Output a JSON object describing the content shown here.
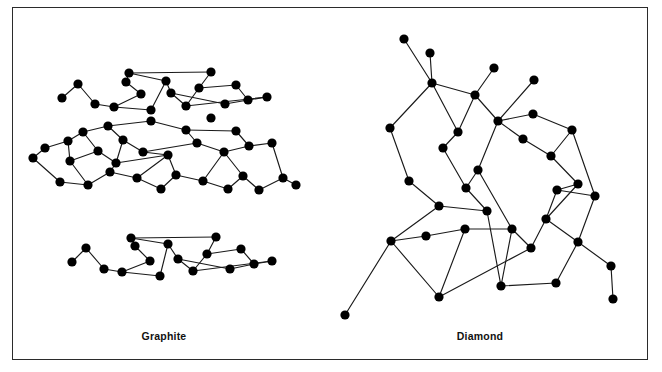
{
  "figure": {
    "border_color": "#2b2b2b",
    "background": "#ffffff",
    "node_color": "#000000",
    "bond_color": "#1a1a1a"
  },
  "labels": {
    "graphite": "Graphite",
    "diamond": "Diamond"
  },
  "caption": {
    "text": ""
  },
  "chart_data": {
    "type": "diagram",
    "title": "",
    "panels": [
      {
        "name": "graphite",
        "label": "Graphite",
        "structure": "layered hexagonal sheets",
        "layer_count": 3,
        "node_radius": 4.6,
        "layers": [
          {
            "name": "top-layer",
            "nodes": [
              [
                62,
                98
              ],
              [
                78,
                84
              ],
              [
                95,
                104
              ],
              [
                126,
                82
              ],
              [
                141,
                94
              ],
              [
                114,
                107
              ],
              [
                129,
                73
              ],
              [
                166,
                81
              ],
              [
                171,
                93
              ],
              [
                199,
                88
              ],
              [
                186,
                106
              ],
              [
                151,
                110
              ],
              [
                211,
                72
              ],
              [
                236,
                85
              ],
              [
                248,
                100
              ],
              [
                225,
                104
              ],
              [
                267,
                97
              ]
            ],
            "bonds": [
              [
                0,
                1
              ],
              [
                1,
                2
              ],
              [
                2,
                5
              ],
              [
                5,
                4
              ],
              [
                4,
                3
              ],
              [
                3,
                6
              ],
              [
                6,
                7
              ],
              [
                7,
                11
              ],
              [
                11,
                5
              ],
              [
                7,
                8
              ],
              [
                8,
                10
              ],
              [
                10,
                9
              ],
              [
                9,
                12
              ],
              [
                12,
                6
              ],
              [
                8,
                15
              ],
              [
                15,
                14
              ],
              [
                14,
                13
              ],
              [
                13,
                9
              ],
              [
                14,
                16
              ],
              [
                16,
                10
              ]
            ]
          },
          {
            "name": "middle-layer",
            "nodes": [
              [
                33,
                158
              ],
              [
                45,
                148
              ],
              [
                68,
                141
              ],
              [
                83,
                132
              ],
              [
                98,
                151
              ],
              [
                70,
                161
              ],
              [
                108,
                126
              ],
              [
                123,
                140
              ],
              [
                143,
                152
              ],
              [
                116,
                163
              ],
              [
                151,
                121
              ],
              [
                186,
                130
              ],
              [
                197,
                143
              ],
              [
                168,
                155
              ],
              [
                211,
                118
              ],
              [
                236,
                131
              ],
              [
                249,
                146
              ],
              [
                224,
                152
              ],
              [
                272,
                143
              ],
              [
                60,
                182
              ],
              [
                88,
                185
              ],
              [
                110,
                172
              ],
              [
                137,
                178
              ],
              [
                161,
                189
              ],
              [
                176,
                175
              ],
              [
                203,
                181
              ],
              [
                228,
                189
              ],
              [
                243,
                176
              ],
              [
                283,
                178
              ],
              [
                296,
                185
              ],
              [
                259,
                190
              ]
            ],
            "bonds": [
              [
                0,
                1
              ],
              [
                1,
                2
              ],
              [
                2,
                5
              ],
              [
                5,
                4
              ],
              [
                4,
                3
              ],
              [
                3,
                2
              ],
              [
                3,
                6
              ],
              [
                6,
                7
              ],
              [
                7,
                9
              ],
              [
                9,
                4
              ],
              [
                7,
                8
              ],
              [
                8,
                13
              ],
              [
                13,
                9
              ],
              [
                8,
                12
              ],
              [
                12,
                11
              ],
              [
                11,
                10
              ],
              [
                10,
                6
              ],
              [
                12,
                17
              ],
              [
                17,
                16
              ],
              [
                16,
                15
              ],
              [
                15,
                11
              ],
              [
                16,
                18
              ],
              [
                18,
                28
              ],
              [
                0,
                19
              ],
              [
                19,
                20
              ],
              [
                20,
                5
              ],
              [
                20,
                21
              ],
              [
                21,
                9
              ],
              [
                21,
                22
              ],
              [
                22,
                13
              ],
              [
                22,
                23
              ],
              [
                23,
                24
              ],
              [
                24,
                13
              ],
              [
                24,
                25
              ],
              [
                25,
                17
              ],
              [
                25,
                26
              ],
              [
                26,
                27
              ],
              [
                27,
                17
              ],
              [
                27,
                30
              ],
              [
                30,
                28
              ],
              [
                28,
                29
              ]
            ]
          },
          {
            "name": "bottom-layer",
            "nodes": [
              [
                72,
                262
              ],
              [
                86,
                248
              ],
              [
                104,
                269
              ],
              [
                135,
                246
              ],
              [
                150,
                261
              ],
              [
                122,
                272
              ],
              [
                131,
                238
              ],
              [
                168,
                244
              ],
              [
                178,
                259
              ],
              [
                207,
                254
              ],
              [
                193,
                271
              ],
              [
                160,
                276
              ],
              [
                216,
                237
              ],
              [
                241,
                249
              ],
              [
                254,
                264
              ],
              [
                230,
                269
              ],
              [
                272,
                261
              ]
            ],
            "bonds": [
              [
                0,
                1
              ],
              [
                1,
                2
              ],
              [
                2,
                5
              ],
              [
                5,
                4
              ],
              [
                4,
                3
              ],
              [
                3,
                6
              ],
              [
                6,
                7
              ],
              [
                7,
                11
              ],
              [
                11,
                5
              ],
              [
                7,
                8
              ],
              [
                8,
                10
              ],
              [
                10,
                9
              ],
              [
                9,
                12
              ],
              [
                12,
                6
              ],
              [
                8,
                15
              ],
              [
                15,
                14
              ],
              [
                14,
                13
              ],
              [
                13,
                9
              ],
              [
                14,
                16
              ],
              [
                16,
                10
              ]
            ]
          }
        ]
      },
      {
        "name": "diamond",
        "label": "Diamond",
        "structure": "tetrahedral cubic lattice",
        "node_radius": 4.6,
        "nodes": [
          [
            404,
            39
          ],
          [
            430,
            53
          ],
          [
            432,
            83
          ],
          [
            475,
            95
          ],
          [
            494,
            68
          ],
          [
            498,
            121
          ],
          [
            534,
            80
          ],
          [
            390,
            128
          ],
          [
            443,
            148
          ],
          [
            458,
            132
          ],
          [
            523,
            139
          ],
          [
            533,
            114
          ],
          [
            551,
            156
          ],
          [
            572,
            130
          ],
          [
            578,
            184
          ],
          [
            409,
            181
          ],
          [
            466,
            188
          ],
          [
            478,
            170
          ],
          [
            439,
            206
          ],
          [
            487,
            211
          ],
          [
            557,
            190
          ],
          [
            546,
            219
          ],
          [
            595,
            196
          ],
          [
            391,
            241
          ],
          [
            426,
            236
          ],
          [
            465,
            229
          ],
          [
            512,
            229
          ],
          [
            531,
            248
          ],
          [
            578,
            242
          ],
          [
            611,
            266
          ],
          [
            345,
            315
          ],
          [
            439,
            297
          ],
          [
            501,
            286
          ],
          [
            556,
            283
          ],
          [
            613,
            299
          ]
        ],
        "bonds": [
          [
            0,
            2
          ],
          [
            1,
            2
          ],
          [
            2,
            3
          ],
          [
            2,
            7
          ],
          [
            3,
            4
          ],
          [
            3,
            9
          ],
          [
            3,
            5
          ],
          [
            5,
            6
          ],
          [
            5,
            11
          ],
          [
            5,
            10
          ],
          [
            7,
            15
          ],
          [
            15,
            18
          ],
          [
            18,
            23
          ],
          [
            23,
            30
          ],
          [
            9,
            8
          ],
          [
            8,
            16
          ],
          [
            16,
            19
          ],
          [
            19,
            18
          ],
          [
            10,
            12
          ],
          [
            12,
            13
          ],
          [
            13,
            11
          ],
          [
            12,
            14
          ],
          [
            14,
            20
          ],
          [
            20,
            22
          ],
          [
            22,
            28
          ],
          [
            17,
            16
          ],
          [
            17,
            26
          ],
          [
            26,
            25
          ],
          [
            25,
            24
          ],
          [
            24,
            23
          ],
          [
            26,
            27
          ],
          [
            27,
            31
          ],
          [
            21,
            27
          ],
          [
            21,
            28
          ],
          [
            28,
            33
          ],
          [
            28,
            29
          ],
          [
            29,
            34
          ],
          [
            31,
            25
          ],
          [
            32,
            26
          ],
          [
            33,
            32
          ],
          [
            20,
            21
          ],
          [
            14,
            21
          ],
          [
            2,
            9
          ],
          [
            5,
            17
          ],
          [
            13,
            22
          ],
          [
            19,
            32
          ],
          [
            23,
            31
          ]
        ]
      }
    ]
  }
}
